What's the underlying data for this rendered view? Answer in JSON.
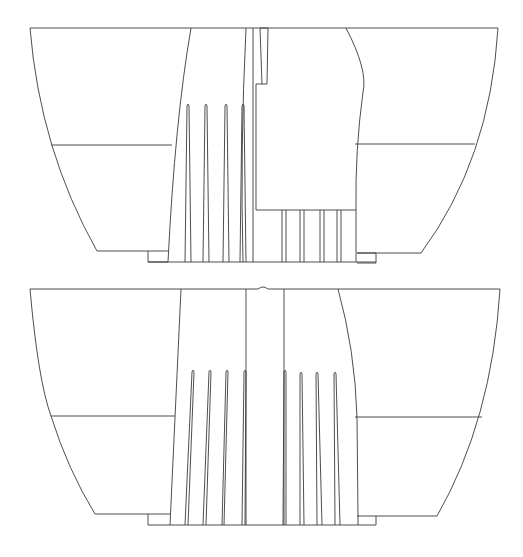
{
  "figure": {
    "width": 523,
    "height": 557,
    "background": "#ffffff",
    "stroke_color": "#3a3a3a",
    "description_visible_text": ""
  },
  "drawings": [
    {
      "id": "top-view",
      "paths": [
        {
          "name": "top-rail",
          "d": "M30 28 L498 28"
        },
        {
          "name": "left-hull-curve",
          "d": "M30 28 Q 40 150 97 251"
        },
        {
          "name": "left-waterline",
          "d": "M51 145 L172 145"
        },
        {
          "name": "left-bottom-edge",
          "d": "M97 251 L168 251"
        },
        {
          "name": "left-base-step",
          "d": "M148 251 L148 262 L168 262"
        },
        {
          "name": "left-shaft-outer",
          "d": "M191 28 Q 175 120 168 262"
        },
        {
          "name": "center-left-shaft-line",
          "d": "M246 28 Q 240 150 243 262"
        },
        {
          "name": "center-inner-line",
          "d": "M253 28 L253 262"
        },
        {
          "name": "keyway-slot",
          "d": "M260 28 L268 28 L267 84 L262 84 L260 28"
        },
        {
          "name": "cutaway-outline",
          "d": "M262 84 L256 84 L256 210 L356 210"
        },
        {
          "name": "right-shaft-curve",
          "d": "M346 28 Q 368 70 363 92 Q 355 150 356 210 L356 262"
        },
        {
          "name": "right-waterline",
          "d": "M355 144 L475 144"
        },
        {
          "name": "right-hull-curve",
          "d": "M498 28 Q 490 160 421 253"
        },
        {
          "name": "right-bottom-edge",
          "d": "M357 253 L421 253"
        },
        {
          "name": "right-base-step",
          "d": "M357 253 L376 253 L376 263 L357 263"
        },
        {
          "name": "base-line",
          "d": "M148 262 L376 262"
        }
      ],
      "flutes": [
        {
          "name": "flute-1",
          "d": "M185 262 L187 106 Q 188 102 189 106 L191 262"
        },
        {
          "name": "flute-2",
          "d": "M203 262 L205 106 Q 206 102 207 106 L209 262"
        },
        {
          "name": "flute-3",
          "d": "M223 262 L225 106 Q 226 102 227 106 L229 262"
        },
        {
          "name": "flute-4",
          "d": "M240 262 L242 106 Q 243 102 244 106 L246 262"
        },
        {
          "name": "lower-flute-1",
          "d": "M282 210 L282 262 M286 210 L286 262"
        },
        {
          "name": "lower-flute-2",
          "d": "M300 210 L300 262 M304 210 L304 262"
        },
        {
          "name": "lower-flute-3",
          "d": "M320 210 L320 262 M324 210 L324 262"
        },
        {
          "name": "lower-flute-4",
          "d": "M337 210 L337 262 M341 210 L341 262"
        }
      ]
    },
    {
      "id": "bottom-view",
      "paths": [
        {
          "name": "top-rail-left",
          "d": "M30 289 L258 289"
        },
        {
          "name": "top-notch",
          "d": "M258 289 Q 263 285 268 289"
        },
        {
          "name": "top-rail-right",
          "d": "M268 289 L500 289"
        },
        {
          "name": "left-hull-curve",
          "d": "M30 289 Q 38 380 51 416 Q 68 470 95 514"
        },
        {
          "name": "left-waterline",
          "d": "M51 416 L175 416"
        },
        {
          "name": "left-bottom-edge",
          "d": "M95 514 L170 514"
        },
        {
          "name": "left-base-step",
          "d": "M148 514 L148 525"
        },
        {
          "name": "left-shaft-line",
          "d": "M181 289 L170 525"
        },
        {
          "name": "center-left-line",
          "d": "M246 289 L246 525"
        },
        {
          "name": "center-right-line",
          "d": "M284 289 L284 525"
        },
        {
          "name": "right-shaft-curve",
          "d": "M338 289 Q 355 350 357 417 L358 516 L358 525"
        },
        {
          "name": "right-waterline",
          "d": "M355 417 L482 417"
        },
        {
          "name": "right-hull-curve",
          "d": "M500 289 Q 492 420 437 516"
        },
        {
          "name": "right-bottom-edge",
          "d": "M357 516 L437 516"
        },
        {
          "name": "right-base-step",
          "d": "M376 516 L376 525"
        },
        {
          "name": "base-line",
          "d": "M148 525 L376 525"
        }
      ],
      "flutes": [
        {
          "name": "left-flute-1",
          "d": "M185 525 L192 372 Q 193 368 194 372 L188 525"
        },
        {
          "name": "left-flute-2",
          "d": "M203 525 L209 372 Q 210 368 211 372 L206 525"
        },
        {
          "name": "left-flute-3",
          "d": "M222 525 L226 372 Q 227 368 228 372 L224 525"
        },
        {
          "name": "left-flute-4",
          "d": "M242 525 L244 372 Q 245 368 246 372 L245 525"
        },
        {
          "name": "right-flute-1",
          "d": "M283 525 L284 372 Q 285 368 286 372 L286 525"
        },
        {
          "name": "right-flute-2",
          "d": "M300 525 L300 374 Q 301 370 302 374 L304 525"
        },
        {
          "name": "right-flute-3",
          "d": "M317 525 L316 374 Q 317 370 318 374 L322 525"
        },
        {
          "name": "right-flute-4",
          "d": "M335 525 L334 374 Q 335 370 336 374 L340 525"
        }
      ]
    }
  ]
}
